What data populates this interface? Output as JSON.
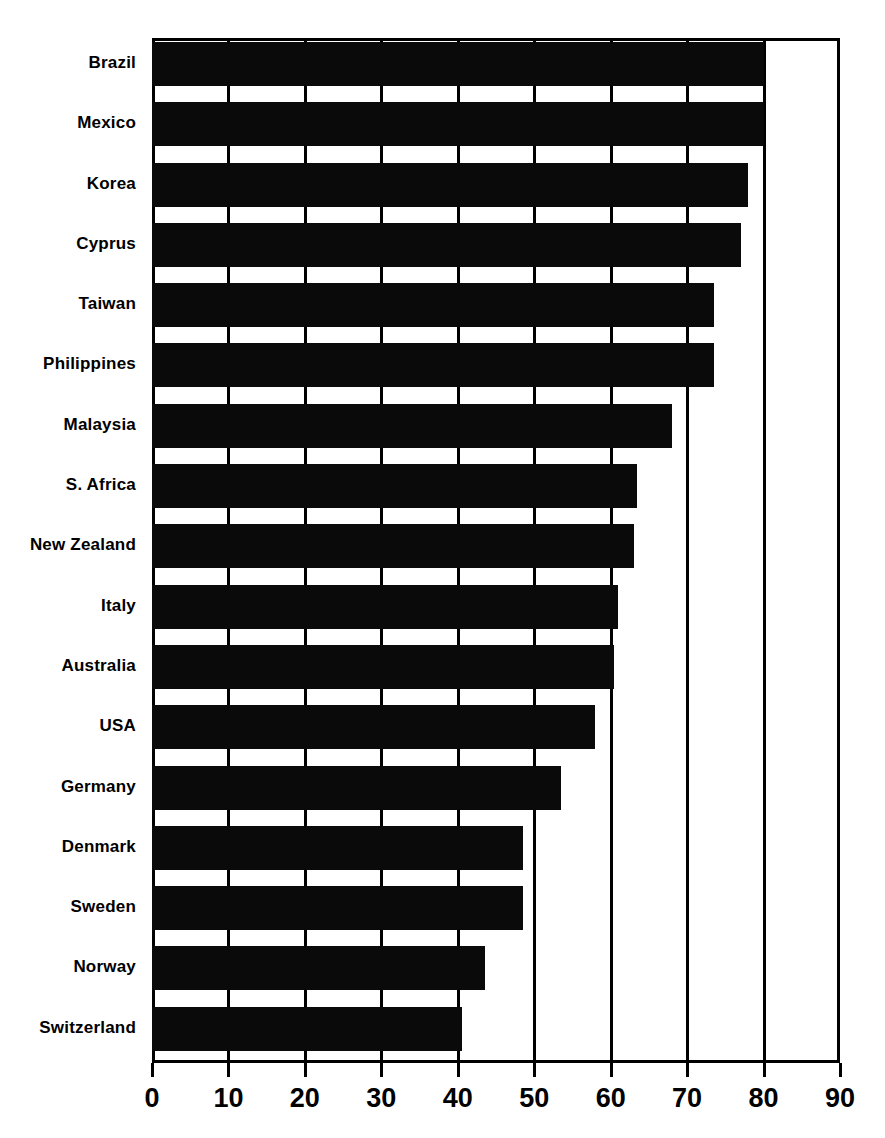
{
  "chart_data": {
    "type": "bar",
    "orientation": "horizontal",
    "title": "",
    "subtitle": "",
    "xlabel": "",
    "ylabel": "",
    "xlim": [
      0,
      90
    ],
    "xticks": [
      0,
      10,
      20,
      30,
      40,
      50,
      60,
      70,
      80,
      90
    ],
    "xtick_labels": [
      "0",
      "10",
      "20",
      "30",
      "40",
      "50",
      "60",
      "70",
      "80",
      "90"
    ],
    "grid": true,
    "grid_axis": "x",
    "legend": false,
    "legend_position": "none",
    "bar_color": "#0a0a0a",
    "frame_color": "#000000",
    "categories": [
      "Brazil",
      "Mexico",
      "Korea",
      "Cyprus",
      "Taiwan",
      "Philippines",
      "Malaysia",
      "S. Africa",
      "New Zealand",
      "Italy",
      "Australia",
      "USA",
      "Germany",
      "Denmark",
      "Sweden",
      "Norway",
      "Switzerland"
    ],
    "values": [
      80,
      80,
      78,
      77,
      73.5,
      73.5,
      68,
      63.5,
      63,
      61,
      60.5,
      58,
      53.5,
      48.5,
      48.5,
      43.5,
      40.5
    ],
    "annotations": []
  }
}
